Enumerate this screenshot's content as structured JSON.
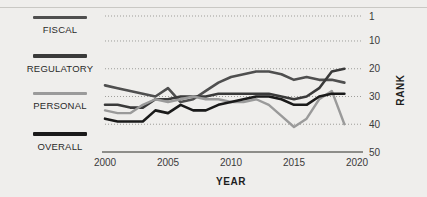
{
  "background": "#efeeec",
  "legend": {
    "items": [
      {
        "label": "FISCAL",
        "color": "#4f4f4f",
        "thickness": 3.2
      },
      {
        "label": "REGULATORY",
        "color": "#3a3a3a",
        "thickness": 3.6
      },
      {
        "label": "PERSONAL",
        "color": "#9a9a9a",
        "thickness": 2.8
      },
      {
        "label": "OVERALL",
        "color": "#1a1a1a",
        "thickness": 4.0
      }
    ]
  },
  "chart_data": {
    "type": "line",
    "title": "",
    "xlabel": "YEAR",
    "ylabel": "RANK",
    "xlim": [
      2000,
      2020
    ],
    "ylim": [
      1,
      50
    ],
    "y_inverted": true,
    "grid": true,
    "grid_style": "dotted-horizontal",
    "legend_position": "left",
    "xticks": [
      2000,
      2005,
      2010,
      2015,
      2020
    ],
    "xticklabels": [
      "2000",
      "2005",
      "2010",
      "2015",
      "2020"
    ],
    "yticks": [
      1,
      10,
      20,
      30,
      40,
      50
    ],
    "yticklabels": [
      "1",
      "10",
      "20",
      "30",
      "40",
      "50"
    ],
    "x": [
      2000,
      2001,
      2002,
      2003,
      2004,
      2005,
      2006,
      2007,
      2008,
      2009,
      2010,
      2011,
      2012,
      2013,
      2014,
      2015,
      2016,
      2017,
      2018,
      2019
    ],
    "series": [
      {
        "name": "FISCAL",
        "color": "#4f4f4f",
        "width": 2.6,
        "values": [
          26,
          27,
          28,
          29,
          30,
          27,
          32,
          31,
          28,
          25,
          23,
          22,
          21,
          21,
          22,
          24,
          23,
          24,
          24,
          25
        ]
      },
      {
        "name": "REGULATORY",
        "color": "#3a3a3a",
        "width": 2.6,
        "values": [
          33,
          33,
          34,
          34,
          31,
          31,
          30,
          30,
          30,
          29,
          29,
          29,
          29,
          29,
          30,
          31,
          30,
          27,
          21,
          20
        ]
      },
      {
        "name": "PERSONAL",
        "color": "#9a9a9a",
        "width": 2.4,
        "values": [
          35,
          36,
          36,
          33,
          31,
          32,
          31,
          30,
          31,
          31,
          32,
          32,
          31,
          33,
          37,
          41,
          38,
          31,
          28,
          40
        ]
      },
      {
        "name": "OVERALL",
        "color": "#1a1a1a",
        "width": 2.6,
        "values": [
          38,
          39,
          39,
          39,
          35,
          36,
          33,
          35,
          35,
          33,
          32,
          31,
          30,
          30,
          31,
          33,
          33,
          30,
          29,
          29
        ]
      }
    ]
  },
  "colors": {
    "grid": "#9e9d99",
    "axis": "#6d6c68",
    "text": "#2a2a2a",
    "rule": "#c9c8c4"
  }
}
